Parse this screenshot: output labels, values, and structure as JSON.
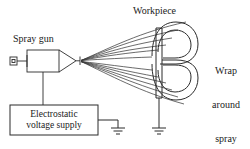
{
  "figure": {
    "line_color": "#2b2b2b",
    "text_color": "#1a1a1a",
    "background": "#ffffff"
  },
  "labels": {
    "spray_gun": "Spray gun",
    "workpiece": "Workpiece",
    "wrap_around": "Wrap\naround\nspray",
    "wrap_around_line1": "Wrap",
    "wrap_around_line2": "around",
    "wrap_around_line3": "spray",
    "supply_line1": "Electrostatic",
    "supply_line2": "voltage supply"
  },
  "components": [
    {
      "name": "spray-gun",
      "label": "Spray gun",
      "kind": "device",
      "parts": [
        "rear-connector",
        "body",
        "tapered-barrel",
        "nozzle-tip"
      ]
    },
    {
      "name": "electrostatic-voltage-supply",
      "label": "Electrostatic voltage supply",
      "kind": "box",
      "connections": [
        "spray-gun",
        "earth-ground"
      ]
    },
    {
      "name": "workpiece",
      "label": "Workpiece",
      "kind": "curved-profile",
      "connections": [
        "earth-ground"
      ]
    },
    {
      "name": "spray-cloud",
      "label": "Wrap around spray",
      "kind": "streamlines",
      "stream_count": 12
    },
    {
      "name": "ground-supply",
      "label": "Ground",
      "kind": "earth-symbol"
    },
    {
      "name": "ground-workpiece",
      "label": "Ground",
      "kind": "earth-symbol"
    }
  ]
}
